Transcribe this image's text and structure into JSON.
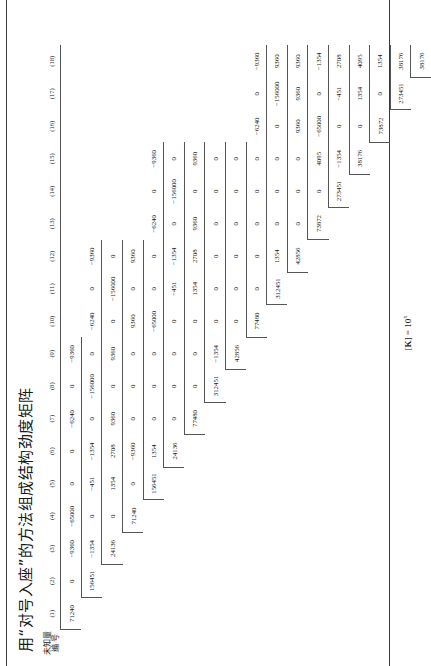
{
  "document": {
    "title": "用“对号入座”的方法组成结构劲度矩阵",
    "caption_prefix": "[",
    "caption_symbol": "K",
    "caption_mid": "] = 10",
    "caption_exponent": "x"
  },
  "header": {
    "stub_line1": "未知量",
    "stub_line2": "编  号",
    "columns": [
      "(1)",
      "(2)",
      "(3)",
      "(4)",
      "(5)",
      "(6)",
      "(7)",
      "(8)",
      "(9)",
      "(10)",
      "(11)",
      "(12)",
      "(13)",
      "(14)",
      "(15)",
      "(16)",
      "(17)",
      "(18)"
    ]
  },
  "chart_data": {
    "type": "table",
    "title": "用“对号入座”的方法组成结构劲度矩阵",
    "row_labels": [
      "(1)",
      "(2)",
      "(3)",
      "(4)",
      "(5)",
      "(6)",
      "(7)",
      "(8)",
      "(9)",
      "(10)",
      "(11)",
      "(12)",
      "(13)",
      "(14)",
      "(15)",
      "(16)",
      "(17)",
      "(18)"
    ],
    "col_labels": [
      "(1)",
      "(2)",
      "(3)",
      "(4)",
      "(5)",
      "(6)",
      "(7)",
      "(8)",
      "(9)",
      "(10)",
      "(11)",
      "(12)",
      "(13)",
      "(14)",
      "(15)",
      "(16)",
      "(17)",
      "(18)"
    ],
    "triangular": "upper",
    "rows": [
      [
        "71240",
        "0",
        "-9360",
        "-65000",
        "0",
        "0",
        "-6240",
        "0",
        "-9360",
        "",
        "",
        "",
        "",
        "",
        "",
        "",
        "",
        ""
      ],
      [
        "",
        "156451",
        "-1354",
        "0",
        "-451",
        "-1354",
        "0",
        "-156000",
        "0",
        "-9360",
        "0",
        "-9360",
        "",
        "",
        "",
        "",
        "",
        ""
      ],
      [
        "",
        "",
        "24136",
        "0",
        "1354",
        "2708",
        "9360",
        "0",
        "9360",
        "0",
        "0",
        "9360",
        "",
        "",
        "",
        "",
        "",
        ""
      ],
      [
        "",
        "",
        "",
        "71240",
        "0",
        "-9360",
        "0",
        "0",
        "0",
        "-65000",
        "0",
        "0",
        "-6240",
        "0",
        "-9360",
        "",
        "",
        ""
      ],
      [
        "",
        "",
        "",
        "",
        "156451",
        "1354",
        "0",
        "0",
        "0",
        "0",
        "-451",
        "-1354",
        "0",
        "-156000",
        "0",
        "",
        "",
        ""
      ],
      [
        "",
        "",
        "",
        "",
        "",
        "24136",
        "0",
        "0",
        "0",
        "0",
        "1354",
        "2708",
        "9360",
        "0",
        "9360",
        "",
        "",
        ""
      ],
      [
        "",
        "",
        "",
        "",
        "",
        "",
        "77480",
        "0",
        "0",
        "0",
        "0",
        "0",
        "0",
        "0",
        "0",
        "",
        "",
        ""
      ],
      [
        "",
        "",
        "",
        "",
        "",
        "",
        "",
        "312451",
        "-1354",
        "0",
        "0",
        "0",
        "0",
        "0",
        "0",
        "",
        "",
        ""
      ],
      [
        "",
        "",
        "",
        "",
        "",
        "",
        "",
        "",
        "42856",
        "0",
        "1354",
        "1354",
        "0",
        "0",
        "0",
        "",
        "",
        ""
      ],
      [
        "",
        "",
        "",
        "",
        "",
        "",
        "",
        "",
        "",
        "77480",
        "0",
        "0",
        "0",
        "0",
        "0",
        "0",
        "0",
        "0"
      ],
      [
        "",
        "",
        "",
        "",
        "",
        "",
        "",
        "",
        "",
        "",
        "312451",
        "-1354",
        "0",
        "0",
        "0",
        "0",
        "0",
        "0"
      ],
      [
        "",
        "",
        "",
        "",
        "",
        "",
        "",
        "",
        "",
        "",
        "",
        "42856",
        "0",
        "1354",
        "0",
        "42856",
        "0",
        "0"
      ],
      [
        "",
        "",
        "",
        "",
        "",
        "",
        "",
        "",
        "",
        "",
        "",
        "",
        "73872",
        "0",
        "0",
        "0",
        "0",
        "0"
      ],
      [
        "",
        "",
        "",
        "",
        "",
        "",
        "",
        "",
        "",
        "",
        "",
        "",
        "",
        "273451",
        "-1354",
        "4095",
        "-1354",
        "-1354"
      ],
      [
        "",
        "",
        "",
        "",
        "",
        "",
        "",
        "",
        "",
        "",
        "",
        "",
        "",
        "",
        "38176",
        "0",
        "38176",
        "38176"
      ],
      [
        "",
        "",
        "",
        "",
        "",
        "",
        "",
        "",
        "",
        "",
        "",
        "",
        "",
        "",
        "",
        "73872",
        "0",
        "4095"
      ],
      [
        "",
        "",
        "",
        "",
        "",
        "",
        "",
        "",
        "",
        "",
        "",
        "",
        "",
        "",
        "",
        "",
        "273451",
        "1354"
      ],
      [
        "",
        "",
        "",
        "",
        "",
        "",
        "",
        "",
        "",
        "",
        "",
        "",
        "",
        "",
        "",
        "",
        "",
        "38176"
      ]
    ],
    "displayed_cells": [
      {
        "r": 1,
        "c": 1,
        "v": "71240"
      },
      {
        "r": 1,
        "c": 2,
        "v": "0"
      },
      {
        "r": 1,
        "c": 3,
        "v": "-9360"
      },
      {
        "r": 1,
        "c": 4,
        "v": "-65000"
      },
      {
        "r": 1,
        "c": 5,
        "v": "0"
      },
      {
        "r": 1,
        "c": 6,
        "v": "0"
      },
      {
        "r": 1,
        "c": 7,
        "v": "-6240"
      },
      {
        "r": 1,
        "c": 8,
        "v": "0"
      },
      {
        "r": 1,
        "c": 9,
        "v": "-9360"
      },
      {
        "r": 2,
        "c": 2,
        "v": "156451"
      },
      {
        "r": 2,
        "c": 3,
        "v": "-1354"
      },
      {
        "r": 2,
        "c": 4,
        "v": "0"
      },
      {
        "r": 2,
        "c": 5,
        "v": "-451"
      },
      {
        "r": 2,
        "c": 6,
        "v": "-1354"
      },
      {
        "r": 2,
        "c": 7,
        "v": "0"
      },
      {
        "r": 2,
        "c": 8,
        "v": "-156000"
      },
      {
        "r": 2,
        "c": 9,
        "v": "0"
      },
      {
        "r": 2,
        "c": 10,
        "v": "-6240"
      },
      {
        "r": 2,
        "c": 11,
        "v": "0"
      },
      {
        "r": 2,
        "c": 12,
        "v": "-9360"
      },
      {
        "r": 3,
        "c": 3,
        "v": "24136"
      },
      {
        "r": 3,
        "c": 4,
        "v": "0"
      },
      {
        "r": 3,
        "c": 5,
        "v": "1354"
      },
      {
        "r": 3,
        "c": 6,
        "v": "2708"
      },
      {
        "r": 3,
        "c": 7,
        "v": "9360"
      },
      {
        "r": 3,
        "c": 8,
        "v": "0"
      },
      {
        "r": 3,
        "c": 9,
        "v": "9360"
      },
      {
        "r": 3,
        "c": 10,
        "v": "0"
      },
      {
        "r": 3,
        "c": 11,
        "v": "-156000"
      },
      {
        "r": 3,
        "c": 12,
        "v": "0"
      },
      {
        "r": 4,
        "c": 4,
        "v": "71240"
      },
      {
        "r": 4,
        "c": 5,
        "v": "0"
      },
      {
        "r": 4,
        "c": 6,
        "v": "-9360"
      },
      {
        "r": 4,
        "c": 7,
        "v": "0"
      },
      {
        "r": 4,
        "c": 8,
        "v": "0"
      },
      {
        "r": 4,
        "c": 9,
        "v": "0"
      },
      {
        "r": 4,
        "c": 10,
        "v": "9360"
      },
      {
        "r": 4,
        "c": 11,
        "v": "0"
      },
      {
        "r": 4,
        "c": 12,
        "v": "9360"
      },
      {
        "r": 5,
        "c": 5,
        "v": "156451"
      },
      {
        "r": 5,
        "c": 6,
        "v": "1354"
      },
      {
        "r": 5,
        "c": 7,
        "v": "0"
      },
      {
        "r": 5,
        "c": 8,
        "v": "0"
      },
      {
        "r": 5,
        "c": 9,
        "v": "0"
      },
      {
        "r": 5,
        "c": 10,
        "v": "-65000"
      },
      {
        "r": 5,
        "c": 11,
        "v": "0"
      },
      {
        "r": 5,
        "c": 12,
        "v": "0"
      },
      {
        "r": 5,
        "c": 13,
        "v": "-6240"
      },
      {
        "r": 5,
        "c": 14,
        "v": "0"
      },
      {
        "r": 5,
        "c": 15,
        "v": "-9360"
      },
      {
        "r": 6,
        "c": 6,
        "v": "24136"
      },
      {
        "r": 6,
        "c": 7,
        "v": "0"
      },
      {
        "r": 6,
        "c": 8,
        "v": "0"
      },
      {
        "r": 6,
        "c": 9,
        "v": "0"
      },
      {
        "r": 6,
        "c": 10,
        "v": "0"
      },
      {
        "r": 6,
        "c": 11,
        "v": "-451"
      },
      {
        "r": 6,
        "c": 12,
        "v": "-1354"
      },
      {
        "r": 6,
        "c": 13,
        "v": "0"
      },
      {
        "r": 6,
        "c": 14,
        "v": "-156000"
      },
      {
        "r": 6,
        "c": 15,
        "v": "0"
      },
      {
        "r": 7,
        "c": 7,
        "v": "77480"
      },
      {
        "r": 7,
        "c": 8,
        "v": "0"
      },
      {
        "r": 7,
        "c": 9,
        "v": "0"
      },
      {
        "r": 7,
        "c": 10,
        "v": "0"
      },
      {
        "r": 7,
        "c": 11,
        "v": "1354"
      },
      {
        "r": 7,
        "c": 12,
        "v": "2708"
      },
      {
        "r": 7,
        "c": 13,
        "v": "9360"
      },
      {
        "r": 7,
        "c": 14,
        "v": "0"
      },
      {
        "r": 7,
        "c": 15,
        "v": "9360"
      },
      {
        "r": 8,
        "c": 8,
        "v": "312451"
      },
      {
        "r": 8,
        "c": 9,
        "v": "-1354"
      },
      {
        "r": 8,
        "c": 10,
        "v": "0"
      },
      {
        "r": 8,
        "c": 11,
        "v": "0"
      },
      {
        "r": 8,
        "c": 12,
        "v": "0"
      },
      {
        "r": 8,
        "c": 13,
        "v": "0"
      },
      {
        "r": 8,
        "c": 14,
        "v": "0"
      },
      {
        "r": 8,
        "c": 15,
        "v": "0"
      },
      {
        "r": 9,
        "c": 9,
        "v": "42856"
      },
      {
        "r": 9,
        "c": 10,
        "v": "0"
      },
      {
        "r": 9,
        "c": 11,
        "v": "0"
      },
      {
        "r": 9,
        "c": 12,
        "v": "0"
      },
      {
        "r": 9,
        "c": 13,
        "v": "0"
      },
      {
        "r": 9,
        "c": 14,
        "v": "0"
      },
      {
        "r": 9,
        "c": 15,
        "v": "0"
      },
      {
        "r": 10,
        "c": 10,
        "v": "77480"
      },
      {
        "r": 10,
        "c": 11,
        "v": "0"
      },
      {
        "r": 10,
        "c": 12,
        "v": "0"
      },
      {
        "r": 10,
        "c": 13,
        "v": "0"
      },
      {
        "r": 10,
        "c": 14,
        "v": "0"
      },
      {
        "r": 10,
        "c": 15,
        "v": "0"
      },
      {
        "r": 10,
        "c": 16,
        "v": "-6240"
      },
      {
        "r": 10,
        "c": 17,
        "v": "0"
      },
      {
        "r": 10,
        "c": 18,
        "v": "-9360"
      },
      {
        "r": 11,
        "c": 11,
        "v": "312451"
      },
      {
        "r": 11,
        "c": 12,
        "v": "1354"
      },
      {
        "r": 11,
        "c": 13,
        "v": "0"
      },
      {
        "r": 11,
        "c": 14,
        "v": "0"
      },
      {
        "r": 11,
        "c": 15,
        "v": "0"
      },
      {
        "r": 11,
        "c": 16,
        "v": "0"
      },
      {
        "r": 11,
        "c": 17,
        "v": "-156000"
      },
      {
        "r": 11,
        "c": 18,
        "v": "9360"
      },
      {
        "r": 12,
        "c": 12,
        "v": "42856"
      },
      {
        "r": 12,
        "c": 13,
        "v": "0"
      },
      {
        "r": 12,
        "c": 14,
        "v": "0"
      },
      {
        "r": 12,
        "c": 15,
        "v": "0"
      },
      {
        "r": 12,
        "c": 16,
        "v": "9360"
      },
      {
        "r": 12,
        "c": 17,
        "v": "9360"
      },
      {
        "r": 12,
        "c": 18,
        "v": "9360"
      },
      {
        "r": 13,
        "c": 13,
        "v": "73872"
      },
      {
        "r": 13,
        "c": 14,
        "v": "0"
      },
      {
        "r": 13,
        "c": 15,
        "v": "4095"
      },
      {
        "r": 13,
        "c": 16,
        "v": "-65000"
      },
      {
        "r": 13,
        "c": 17,
        "v": "0"
      },
      {
        "r": 13,
        "c": 18,
        "v": "-1354"
      },
      {
        "r": 14,
        "c": 14,
        "v": "273451"
      },
      {
        "r": 14,
        "c": 15,
        "v": "-1354"
      },
      {
        "r": 14,
        "c": 16,
        "v": "0"
      },
      {
        "r": 14,
        "c": 17,
        "v": "-451"
      },
      {
        "r": 14,
        "c": 18,
        "v": "2708"
      },
      {
        "r": 15,
        "c": 15,
        "v": "38176"
      },
      {
        "r": 15,
        "c": 16,
        "v": "0"
      },
      {
        "r": 15,
        "c": 17,
        "v": "1354"
      },
      {
        "r": 15,
        "c": 18,
        "v": "4095"
      },
      {
        "r": 16,
        "c": 16,
        "v": "73872"
      },
      {
        "r": 16,
        "c": 17,
        "v": "0"
      },
      {
        "r": 16,
        "c": 18,
        "v": "1354"
      },
      {
        "r": 17,
        "c": 17,
        "v": "273451"
      },
      {
        "r": 17,
        "c": 18,
        "v": "38176"
      },
      {
        "r": 18,
        "c": 18,
        "v": "38176"
      }
    ]
  }
}
